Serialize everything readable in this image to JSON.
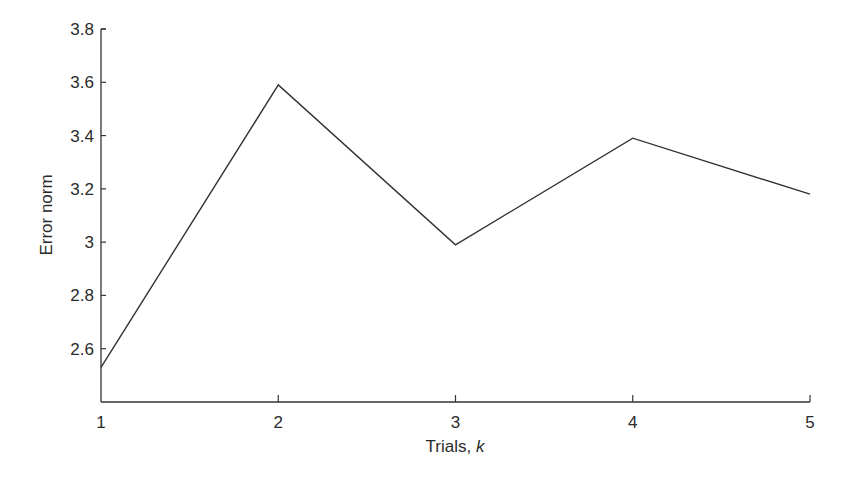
{
  "chart_data": {
    "type": "line",
    "title": "",
    "xlabel": "Trials, k",
    "xlabel_main": "Trials, ",
    "xlabel_var": "k",
    "ylabel": "Error norm",
    "x": [
      1,
      2,
      3,
      4,
      5
    ],
    "series": [
      {
        "name": "Error norm",
        "values": [
          2.53,
          3.59,
          2.99,
          3.39,
          3.18
        ],
        "color": "#333333"
      }
    ],
    "xticks": [
      "1",
      "2",
      "3",
      "4",
      "5"
    ],
    "yticks": [
      "2.6",
      "2.8",
      "3",
      "3.2",
      "3.4",
      "3.6",
      "3.8"
    ],
    "xlim": [
      1,
      5
    ],
    "ylim": [
      2.4,
      3.8
    ],
    "grid": false,
    "legend": "none"
  }
}
